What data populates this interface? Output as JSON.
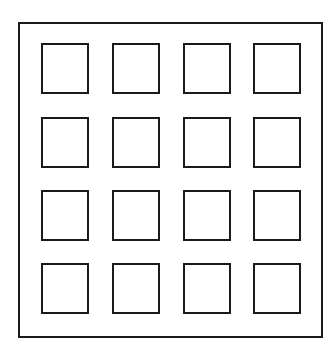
{
  "diagram": {
    "stroke_color": "#1a1a1a",
    "background_color": "#ffffff",
    "outer_frame": {
      "x": 18,
      "y": 22,
      "w": 305,
      "h": 316
    },
    "grid": {
      "rows": 4,
      "cols": 4,
      "col_x": [
        41,
        112,
        183,
        253
      ],
      "row_y": [
        43,
        117,
        190,
        263
      ],
      "cell_w": 48,
      "cell_h": 51
    }
  }
}
